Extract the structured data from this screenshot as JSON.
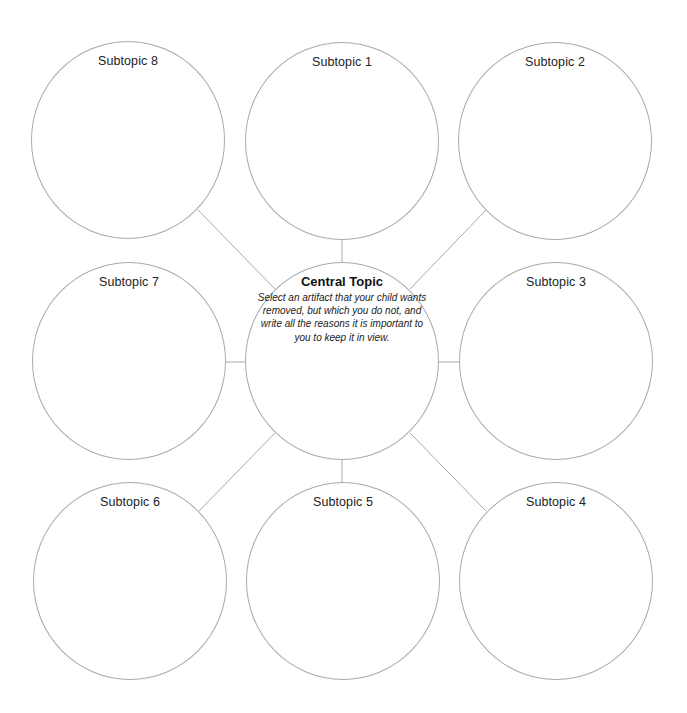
{
  "central": {
    "title": "Central Topic",
    "description": "Select an artifact that your child wants removed, but which you do not, and write all the reasons it is important to you to keep it in view."
  },
  "subtopics": [
    {
      "label": "Subtopic 1"
    },
    {
      "label": "Subtopic 2"
    },
    {
      "label": "Subtopic 3"
    },
    {
      "label": "Subtopic 4"
    },
    {
      "label": "Subtopic 5"
    },
    {
      "label": "Subtopic 6"
    },
    {
      "label": "Subtopic 7"
    },
    {
      "label": "Subtopic 8"
    }
  ],
  "colors": {
    "stroke": "#a9a9a9",
    "text": "#222222",
    "background": "#ffffff"
  }
}
